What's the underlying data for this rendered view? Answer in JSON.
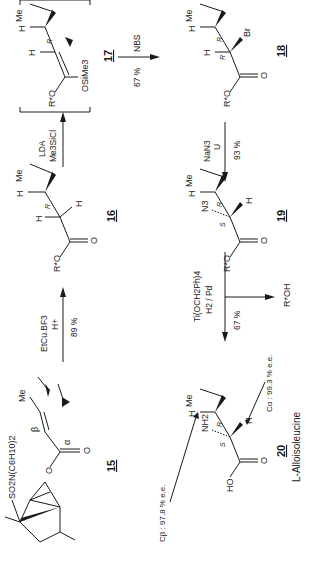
{
  "scheme": {
    "compounds": {
      "c15": {
        "label": "15",
        "substituent": "SO2N(C6H10)2",
        "alpha": "α",
        "beta": "β",
        "me": "Me",
        "o": "O"
      },
      "c16": {
        "label": "16",
        "me": "Me",
        "h": "H",
        "ro": "R*O",
        "o": "O",
        "config": "R"
      },
      "c17": {
        "label": "17",
        "me": "Me",
        "h": "H",
        "ro": "R*O",
        "otms": "OSiMe3",
        "config": "R"
      },
      "c18": {
        "label": "18",
        "me": "Me",
        "h": "H",
        "ro": "R*O",
        "o": "O",
        "br": "Br",
        "config1": "R",
        "config2": "R"
      },
      "c19": {
        "label": "19",
        "me": "Me",
        "h": "H",
        "ro": "R*O",
        "o": "O",
        "n3": "N3",
        "config1": "R",
        "config2": "S"
      },
      "c20": {
        "label": "20",
        "name": "L-Alloisoleucine",
        "me": "Me",
        "h": "H",
        "ho": "HO",
        "o": "O",
        "nh2": "NH2",
        "config1": "R",
        "config2": "S"
      }
    },
    "arrows": {
      "a1": {
        "top": "EtCu.BF3",
        "mid": "H+",
        "bottom": "89 %"
      },
      "a2": {
        "top": "LDA",
        "bottom": "Me3SiCl"
      },
      "a3": {
        "top": "NBS",
        "bottom": "67 %"
      },
      "a4": {
        "top": "NaN3",
        "mid": "U",
        "bottom": "93 %"
      },
      "a5": {
        "top": "Ti(OCH2Ph)4",
        "mid": "H2 / Pd",
        "bottom": "67 %",
        "byproduct": "R*OH"
      }
    },
    "annotations": {
      "cbeta": "Cβ : 97.8 % e.e.",
      "calpha": "Cα : 99.3 % e.e."
    }
  }
}
